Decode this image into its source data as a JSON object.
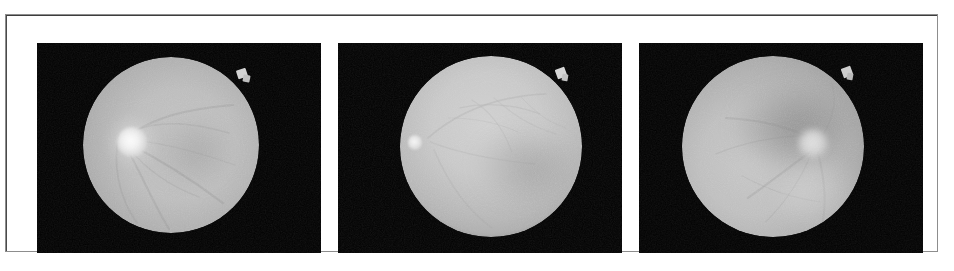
{
  "figure": {
    "kind": "fundus-photograph-triptych",
    "modality": "grayscale retinal fundus photography",
    "panel_count": 3,
    "frame": {
      "border_color": "#4a4a4a",
      "background_color": "#ffffff"
    },
    "panels": [
      {
        "id": "panel-a",
        "label": "",
        "background_color": "#050505",
        "retina": {
          "center_x_pct": 47.5,
          "center_y_pct": 49.0,
          "radius_pct": 31.0,
          "base_color": "#b9b9b9",
          "rim_color": "#9a9a9a"
        },
        "optic_disc": {
          "present": true,
          "position": "left-of-center",
          "center_x_pct": 26.0,
          "center_y_pct": 47.5,
          "size_pct": 11.0,
          "brightness_color": "#f4f4f4",
          "description": "bright round optic disc with halo"
        },
        "macula": {
          "present": true,
          "center_x_pct": 56.0,
          "center_y_pct": 50.0,
          "size_pct": 30.0,
          "shade_color": "#a3a3a3"
        },
        "notch": {
          "present": true,
          "position": "upper-right rim",
          "x_pct": 72.0,
          "y_pct": 14.0,
          "color": "#d6d6d6"
        },
        "vessels": "faint arcades sweeping right from the optic disc"
      },
      {
        "id": "panel-b",
        "label": "",
        "background_color": "#060606",
        "retina": {
          "center_x_pct": 54.0,
          "center_y_pct": 49.5,
          "radius_pct": 32.0,
          "base_color": "#c6c6c6",
          "rim_color": "#a5a5a5"
        },
        "optic_disc": {
          "present": true,
          "position": "far left edge",
          "center_x_pct": 27.0,
          "center_y_pct": 47.0,
          "size_pct": 5.0,
          "brightness_color": "#efefef",
          "description": "small bright spot at the nasal rim"
        },
        "macula": {
          "present": true,
          "center_x_pct": 62.0,
          "center_y_pct": 54.0,
          "size_pct": 32.0,
          "shade_color": "#b0b0b0"
        },
        "notch": {
          "present": true,
          "position": "upper-right rim",
          "x_pct": 78.0,
          "y_pct": 14.0,
          "color": "#d9d9d9"
        },
        "vessels": "fine vessel network across the upper half"
      },
      {
        "id": "panel-c",
        "label": "",
        "background_color": "#050505",
        "retina": {
          "center_x_pct": 47.0,
          "center_y_pct": 49.0,
          "radius_pct": 32.0,
          "base_color": "#bdbdbd",
          "rim_color": "#9d9d9d"
        },
        "optic_disc": {
          "present": true,
          "position": "right-of-center",
          "center_x_pct": 70.0,
          "center_y_pct": 46.0,
          "size_pct": 9.0,
          "brightness_color": "#d8d8d8",
          "description": "pale optic disc toward the temporal side"
        },
        "macula": {
          "present": true,
          "center_x_pct": 52.0,
          "center_y_pct": 42.0,
          "size_pct": 36.0,
          "shade_color": "#8d8d8d"
        },
        "notch": {
          "present": true,
          "position": "upper-right rim",
          "x_pct": 73.0,
          "y_pct": 13.0,
          "color": "#cfcfcf"
        },
        "vessels": "broad dark band above centre with lower-right arcade"
      }
    ]
  }
}
